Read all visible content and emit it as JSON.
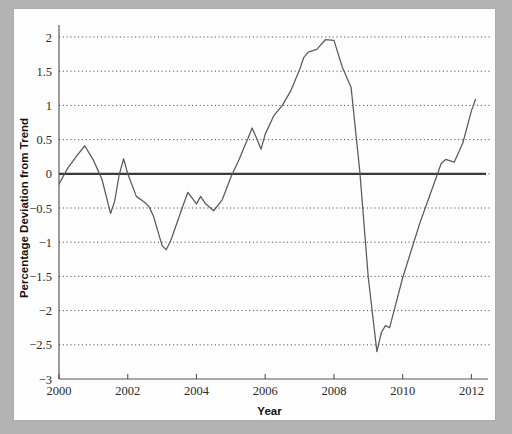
{
  "figure": {
    "background_color": "#b3b3b3",
    "sheet_color": "#fdfdfd",
    "line_color": "#5a5a5a",
    "zero_line_color": "#3a3a3a",
    "grid_color": "#4a4a4a"
  },
  "chart_data": {
    "type": "line",
    "title": "",
    "xlabel": "Year",
    "ylabel": "Percentage Deviation from Trend",
    "xlim": [
      2000,
      2012.25
    ],
    "ylim": [
      -3,
      2
    ],
    "grid": true,
    "grid_axis": "y",
    "legend": "none",
    "xticks": [
      2000,
      2002,
      2004,
      2006,
      2008,
      2010,
      2012
    ],
    "xtick_labels": [
      "2000",
      "2002",
      "2004",
      "2006",
      "2008",
      "2010",
      "2012"
    ],
    "yticks": [
      2,
      1.5,
      1,
      0.5,
      0,
      -0.5,
      -1,
      -1.5,
      -2,
      -2.5,
      -3
    ],
    "ytick_labels": [
      "2",
      "1.5",
      "1",
      "0.5",
      "0",
      "−0.5",
      "−1",
      "−1.5",
      "−2",
      "−2.5",
      "−3"
    ],
    "reference_line": {
      "value": 0,
      "style": "solid",
      "width": 2.2
    },
    "series": [
      {
        "name": "Percentage deviation from trend",
        "x": [
          2000.0,
          2000.25,
          2000.5,
          2000.75,
          2001.0,
          2001.25,
          2001.5,
          2001.62,
          2001.75,
          2001.88,
          2002.0,
          2002.25,
          2002.5,
          2002.62,
          2002.75,
          2003.0,
          2003.12,
          2003.25,
          2003.5,
          2003.62,
          2003.75,
          2003.88,
          2004.0,
          2004.12,
          2004.25,
          2004.5,
          2004.75,
          2005.0,
          2005.25,
          2005.38,
          2005.5,
          2005.62,
          2005.75,
          2005.88,
          2006.0,
          2006.25,
          2006.5,
          2006.75,
          2007.0,
          2007.12,
          2007.25,
          2007.5,
          2007.75,
          2008.0,
          2008.25,
          2008.38,
          2008.5,
          2008.75,
          2009.0,
          2009.25,
          2009.38,
          2009.5,
          2009.62,
          2009.75,
          2010.0,
          2010.5,
          2011.0,
          2011.12,
          2011.25,
          2011.5,
          2011.75,
          2012.0,
          2012.12
        ],
        "y": [
          -0.15,
          0.08,
          0.25,
          0.41,
          0.2,
          -0.08,
          -0.58,
          -0.4,
          -0.02,
          0.22,
          0.0,
          -0.33,
          -0.42,
          -0.48,
          -0.62,
          -1.05,
          -1.11,
          -0.98,
          -0.62,
          -0.45,
          -0.27,
          -0.36,
          -0.44,
          -0.33,
          -0.43,
          -0.54,
          -0.38,
          -0.05,
          0.22,
          0.38,
          0.52,
          0.67,
          0.52,
          0.36,
          0.58,
          0.85,
          1.0,
          1.22,
          1.52,
          1.7,
          1.78,
          1.82,
          1.96,
          1.95,
          1.55,
          1.4,
          1.26,
          0.05,
          -1.52,
          -2.6,
          -2.32,
          -2.22,
          -2.25,
          -2.0,
          -1.52,
          -0.72,
          -0.02,
          0.15,
          0.21,
          0.17,
          0.45,
          0.92,
          1.09
        ]
      }
    ]
  }
}
